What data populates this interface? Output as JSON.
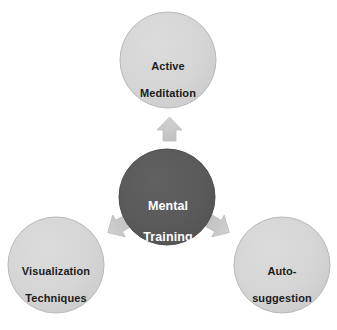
{
  "diagram": {
    "type": "hub-and-spoke",
    "background_color": "#ffffff",
    "hub": {
      "id": "mental-training",
      "label": "Mental\nTraining",
      "line1": "Mental",
      "line2": "Training",
      "shape": "circle",
      "fill_color": "#595959",
      "text_color": "#ffffff",
      "cx": 167,
      "cy": 197,
      "r": 48
    },
    "spokes": [
      {
        "id": "active-meditation",
        "label": "Active\nMeditation",
        "line1": "Active",
        "line2": "Meditation",
        "shape": "circle",
        "fill_color": "#d4d4d4",
        "stroke_color": "#b6b6b6",
        "text_color": "#1c1c1c",
        "cx": 168,
        "cy": 60,
        "r": 48,
        "position": "top"
      },
      {
        "id": "visualization-techniques",
        "label": "Visualization\nTechniques",
        "line1": "Visualization",
        "line2": "Techniques",
        "shape": "circle",
        "fill_color": "#d4d4d4",
        "stroke_color": "#b6b6b6",
        "text_color": "#1c1c1c",
        "cx": 56,
        "cy": 265,
        "r": 48,
        "position": "bottom-left"
      },
      {
        "id": "auto-suggestion",
        "label": "Auto-\nsuggestion",
        "line1": "Auto-",
        "line2": "suggestion",
        "shape": "circle",
        "fill_color": "#d4d4d4",
        "stroke_color": "#b6b6b6",
        "text_color": "#1c1c1c",
        "cx": 282,
        "cy": 265,
        "r": 48,
        "position": "bottom-right"
      }
    ],
    "arrows": [
      {
        "id": "arrow-to-active-meditation",
        "from": "mental-training",
        "to": "active-meditation",
        "direction": "up",
        "angle_deg": 270,
        "fill_color": "#c9c9c9",
        "stroke_color": "#bdbdbd"
      },
      {
        "id": "arrow-to-visualization-techniques",
        "from": "mental-training",
        "to": "visualization-techniques",
        "direction": "down-left",
        "angle_deg": 150,
        "fill_color": "#c9c9c9",
        "stroke_color": "#bdbdbd"
      },
      {
        "id": "arrow-to-auto-suggestion",
        "from": "mental-training",
        "to": "auto-suggestion",
        "direction": "down-right",
        "angle_deg": 30,
        "fill_color": "#c9c9c9",
        "stroke_color": "#bdbdbd"
      }
    ]
  }
}
